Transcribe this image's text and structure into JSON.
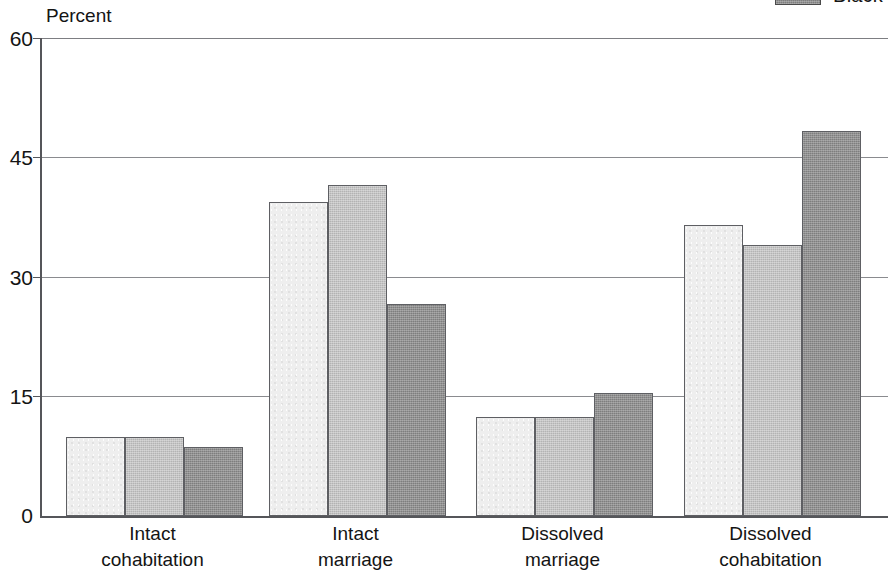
{
  "axis_title": "Percent",
  "legend": {
    "items": [
      {
        "label": "Black",
        "color": "#7e7e7e",
        "series_index": 2
      }
    ]
  },
  "y_axis": {
    "ticks": [
      "0",
      "15",
      "30",
      "45",
      "60"
    ]
  },
  "x_axis": {
    "labels": [
      {
        "line1": "Intact",
        "line2": "cohabitation"
      },
      {
        "line1": "Intact",
        "line2": "marriage"
      },
      {
        "line1": "Dissolved",
        "line2": "marriage"
      },
      {
        "line1": "Dissolved",
        "line2": "cohabitation"
      }
    ]
  },
  "colors": {
    "series_light": "#eeeeee",
    "series_medium": "#b3b3b3",
    "series_dark": "#7e7e7e",
    "axis": "#55565a",
    "grid": "#8a8b8f"
  },
  "chart_data": {
    "type": "bar",
    "title": "",
    "subtitle": "",
    "xlabel": "",
    "ylabel": "Percent",
    "ylim": [
      0,
      60
    ],
    "yticks": [
      0,
      15,
      30,
      45,
      60
    ],
    "grid": true,
    "legend_position": "top-right",
    "categories": [
      "Intact cohabitation",
      "Intact marriage",
      "Dissolved marriage",
      "Dissolved cohabitation"
    ],
    "series": [
      {
        "name": "",
        "color": "#eeeeee",
        "values": [
          10.0,
          39.5,
          12.4,
          36.6
        ]
      },
      {
        "name": "",
        "color": "#b3b3b3",
        "values": [
          10.0,
          41.7,
          12.4,
          34.1
        ]
      },
      {
        "name": "Black",
        "color": "#7e7e7e",
        "values": [
          8.7,
          26.7,
          15.5,
          48.4
        ]
      }
    ]
  }
}
